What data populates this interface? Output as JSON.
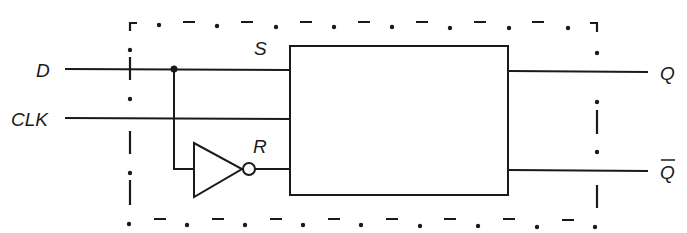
{
  "diagram": {
    "type": "D flip-flop (gated D latch) built from SR flip-flop with inverter",
    "inputs": {
      "d": "D",
      "clk": "CLK"
    },
    "internal": {
      "set": "S",
      "reset": "R"
    },
    "outputs": {
      "q": "Q",
      "q_bar": "Q"
    },
    "components": [
      {
        "name": "SR flip-flop block",
        "ports_in": [
          "S",
          "CLK",
          "R"
        ],
        "ports_out": [
          "Q",
          "Q̄"
        ]
      },
      {
        "name": "inverter (NOT gate)",
        "input": "D",
        "output": "R"
      }
    ],
    "connections": [
      {
        "from": "D",
        "to": "S"
      },
      {
        "from": "D",
        "to": "inverter"
      },
      {
        "from": "inverter",
        "to": "R"
      },
      {
        "from": "CLK",
        "to": "SR flip-flop block"
      },
      {
        "from": "SR flip-flop block",
        "to": "Q"
      },
      {
        "from": "SR flip-flop block",
        "to": "Q̄"
      }
    ],
    "boundary": "dash-dot enclosure"
  }
}
